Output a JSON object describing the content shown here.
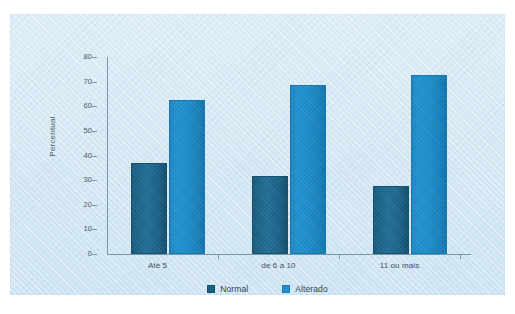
{
  "chart_data": {
    "type": "bar",
    "title": "",
    "subtitle": "",
    "xlabel": "",
    "ylabel": "Percentual",
    "categories": [
      "Até 5",
      "de 6 a 10",
      "11 ou mais"
    ],
    "series": [
      {
        "name": "Normal",
        "color": "#1b5f82",
        "values": [
          37,
          31.5,
          27.5
        ]
      },
      {
        "name": "Alterado",
        "color": "#1f8ecb",
        "values": [
          62.5,
          68.5,
          72.5
        ]
      }
    ],
    "ylim": [
      0,
      80
    ],
    "yticks": [
      0,
      10,
      20,
      30,
      40,
      50,
      60,
      70,
      80
    ],
    "ytick_labels": [
      "0",
      "10",
      "20",
      "30",
      "40",
      "50",
      "60",
      "70",
      "80"
    ],
    "grid": false,
    "legend_position": "bottom",
    "background_color": "#d7eaf5"
  },
  "legend": {
    "entries": [
      {
        "label": "Normal"
      },
      {
        "label": "Alterado"
      }
    ]
  },
  "axis": {
    "y_title": "Percentual"
  }
}
